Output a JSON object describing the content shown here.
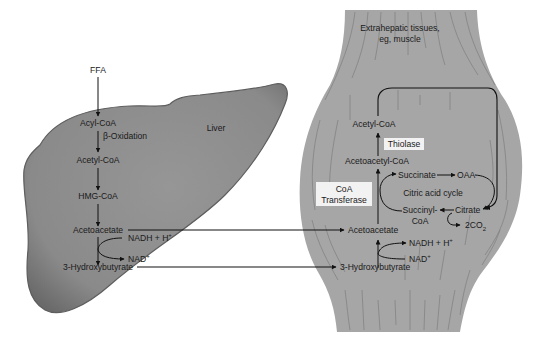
{
  "colors": {
    "background": "#ffffff",
    "liver_fill": "#8c8c8c",
    "liver_edge": "#5e5e5e",
    "muscle_fill": "#a6a6a6",
    "muscle_striation": "#7a7a7a",
    "arrow": "#111111",
    "label_box": "#f2f2f2"
  },
  "liver": {
    "organ_label": "Liver",
    "input": "FFA",
    "acyl_coa": "Acyl-CoA",
    "beta_oxidation": "β-Oxidation",
    "acetyl_coa": "Acetyl-CoA",
    "hmg_coa": "HMG-CoA",
    "acetoacetate": "Acetoacetate",
    "nadh": "NADH + H",
    "nadh_sup": "+",
    "nad": "NAD",
    "nad_sup": "+",
    "hydroxybutyrate": "3-Hydroxybutyrate"
  },
  "muscle": {
    "organ_label_line1": "Extrahepatic tissues,",
    "organ_label_line2": "eg, muscle",
    "acetyl_coa": "Acetyl-CoA",
    "thiolase": "Thiolase",
    "acetoacetyl_coa": "Acetoacetyl-CoA",
    "coa_transferase_line1": "CoA",
    "coa_transferase_line2": "Transferase",
    "acetoacetate": "Acetoacetate",
    "nadh": "NADH + H",
    "nadh_sup": "+",
    "nad": "NAD",
    "nad_sup": "+",
    "hydroxybutyrate": "3-Hydroxybutyrate",
    "tca": {
      "cycle_label": "Citric acid cycle",
      "succinate": "Succinate",
      "oaa": "OAA",
      "citrate": "Citrate",
      "succinyl_coa_line1": "Succinyl-",
      "succinyl_coa_line2": "CoA",
      "co2": "2CO",
      "co2_sub": "2"
    }
  }
}
